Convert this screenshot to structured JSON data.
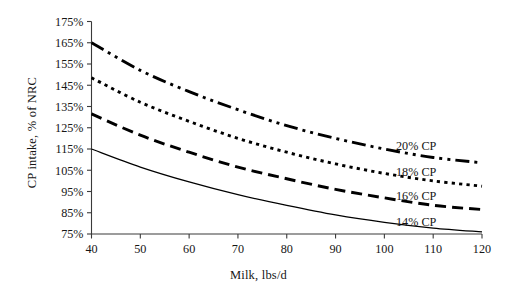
{
  "chart_data": {
    "type": "line",
    "title": "",
    "xlabel": "Milk, lbs/d",
    "ylabel": "CP intake, % of NRC",
    "xlim": [
      40,
      120
    ],
    "ylim": [
      75,
      175
    ],
    "grid": false,
    "legend_position": "inline-right-end-labels",
    "xticks": [
      "40",
      "50",
      "60",
      "70",
      "80",
      "90",
      "100",
      "110",
      "120"
    ],
    "xtick_values": [
      40,
      50,
      60,
      70,
      80,
      90,
      100,
      110,
      120
    ],
    "yticks": [
      "75%",
      "85%",
      "95%",
      "105%",
      "115%",
      "125%",
      "135%",
      "145%",
      "155%",
      "165%",
      "175%"
    ],
    "ytick_values": [
      75,
      85,
      95,
      105,
      115,
      125,
      135,
      145,
      155,
      165,
      175
    ],
    "x": [
      40,
      50,
      60,
      70,
      80,
      90,
      100,
      110,
      120
    ],
    "series": [
      {
        "name": "20% CP",
        "label": "20% CP",
        "style": "dash-dot-dot",
        "color": "#000000",
        "values": [
          165.0,
          152.0,
          142.0,
          133.5,
          126.0,
          120.0,
          115.0,
          111.0,
          108.5
        ]
      },
      {
        "name": "18% CP",
        "label": "18% CP",
        "style": "dotted",
        "color": "#000000",
        "values": [
          148.5,
          137.0,
          128.0,
          120.0,
          113.5,
          108.0,
          103.5,
          100.0,
          97.5
        ]
      },
      {
        "name": "16% CP",
        "label": "16% CP",
        "style": "dashed",
        "color": "#000000",
        "values": [
          131.5,
          121.5,
          113.5,
          106.5,
          101.0,
          96.0,
          92.0,
          88.5,
          86.5
        ]
      },
      {
        "name": "14% CP",
        "label": "14% CP",
        "style": "solid",
        "color": "#000000",
        "values": [
          115.0,
          106.5,
          99.5,
          93.5,
          88.5,
          84.0,
          80.5,
          77.8,
          76.0
        ]
      }
    ]
  }
}
